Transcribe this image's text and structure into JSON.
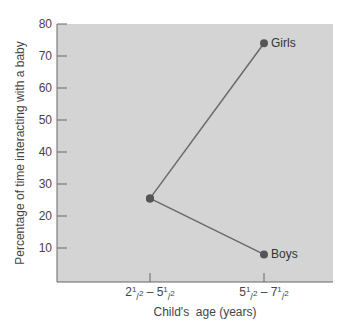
{
  "chart_data": {
    "type": "line",
    "title": "",
    "xlabel": "Child's  age (years)",
    "ylabel": "Percentage of time interacting with a baby",
    "ylim": [
      0,
      80
    ],
    "yticks": [
      10,
      20,
      30,
      40,
      50,
      60,
      70,
      80
    ],
    "categories": [
      "2½ – 5½",
      "5½ – 7½"
    ],
    "x_tick_labels": [
      {
        "main": "2",
        "sup": "1",
        "sub": "2",
        "dash": " – ",
        "main2": "5",
        "sup2": "1",
        "sub2": "2"
      },
      {
        "main": "5",
        "sup": "1",
        "sub": "2",
        "dash": " – ",
        "main2": "7",
        "sup2": "1",
        "sub2": "2"
      }
    ],
    "series": [
      {
        "name": "Girls",
        "values": [
          25.5,
          74
        ]
      },
      {
        "name": "Boys",
        "values": [
          25.5,
          8
        ]
      }
    ],
    "grid": false,
    "legend_position": "inline labels at line ends",
    "colors": {
      "plot_bg": "#d4d4d4",
      "line": "#6a6a6a",
      "marker": "#555555",
      "axis": "#666666"
    }
  }
}
